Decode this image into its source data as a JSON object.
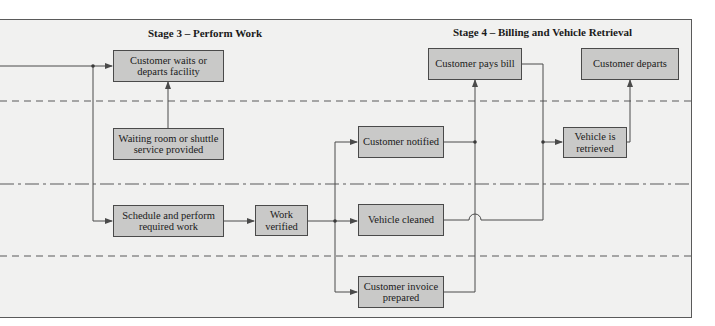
{
  "diagram": {
    "type": "service blueprint (flowchart)",
    "stages": [
      {
        "id": "stage3",
        "title": "Stage 3 – Perform Work"
      },
      {
        "id": "stage4",
        "title": "Stage 4 – Billing and Vehicle Retrieval"
      }
    ],
    "lane_separators": [
      {
        "style": "dashed",
        "meaning": "line of interaction"
      },
      {
        "style": "dash-dot",
        "meaning": "line of visibility"
      },
      {
        "style": "dashed",
        "meaning": "line of internal interaction"
      }
    ],
    "nodes": {
      "customer_waits": {
        "label": "Customer waits or departs facility"
      },
      "waiting_room": {
        "label": "Waiting room or shuttle service provided"
      },
      "schedule_work": {
        "label": "Schedule and perform required work"
      },
      "work_verified": {
        "label": "Work verified"
      },
      "customer_notified": {
        "label": "Customer notified"
      },
      "vehicle_cleaned": {
        "label": "Vehicle cleaned"
      },
      "invoice_prepared": {
        "label": "Customer invoice prepared"
      },
      "customer_pays": {
        "label": "Customer pays bill"
      },
      "customer_departs": {
        "label": "Customer departs"
      },
      "vehicle_retrieved": {
        "label": "Vehicle is retrieved"
      }
    },
    "edges": [
      {
        "from": "incoming",
        "to": "customer_waits"
      },
      {
        "from": "incoming",
        "to": "schedule_work"
      },
      {
        "from": "waiting_room",
        "to": "customer_waits"
      },
      {
        "from": "schedule_work",
        "to": "work_verified"
      },
      {
        "from": "work_verified",
        "to": "customer_notified"
      },
      {
        "from": "work_verified",
        "to": "vehicle_cleaned"
      },
      {
        "from": "work_verified",
        "to": "invoice_prepared"
      },
      {
        "from": "customer_notified",
        "to": "customer_pays"
      },
      {
        "from": "invoice_prepared",
        "to": "customer_pays"
      },
      {
        "from": "customer_pays",
        "to": "vehicle_retrieved"
      },
      {
        "from": "vehicle_cleaned",
        "to": "vehicle_retrieved"
      },
      {
        "from": "vehicle_retrieved",
        "to": "customer_departs"
      }
    ]
  },
  "colors": {
    "background": "#f1f1f0",
    "box_fill": "#c9c9c8",
    "line": "#4a4a4a"
  }
}
